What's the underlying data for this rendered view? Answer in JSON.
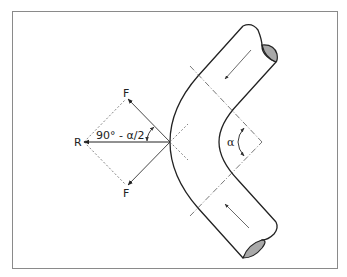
{
  "diagram": {
    "labels": {
      "force_upper": "F",
      "force_lower": "F",
      "resultant": "R",
      "angle_label": "90° - α/2",
      "bend_angle": "α"
    },
    "colors": {
      "frame": "#8a8a8a",
      "stroke": "#222222",
      "dashed": "#666666",
      "pipe_end_fill": "#a9a9a9",
      "background": "#ffffff"
    },
    "flow_direction": [
      "inlet-top-flows-down-left",
      "outlet-bottom-flows-up-left"
    ]
  }
}
